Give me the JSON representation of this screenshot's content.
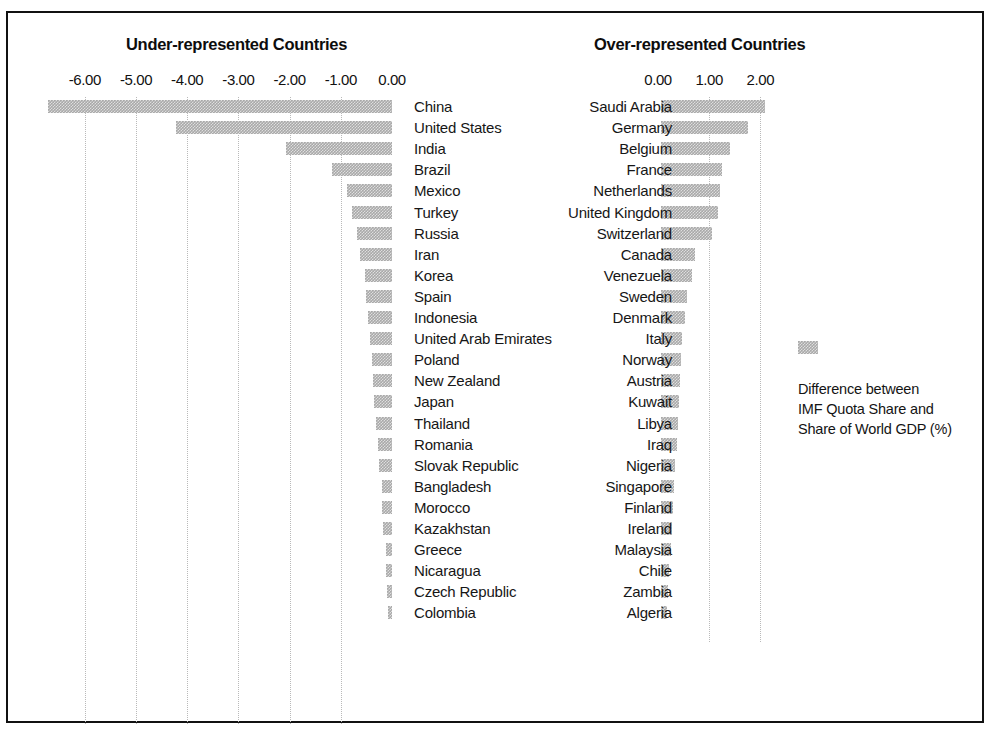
{
  "figure": {
    "legend": {
      "swatch_name": "bar-color-swatch",
      "color": "#a9a9a9",
      "line1": "Difference between",
      "line2": "IMF Quota Share and",
      "line3": "Share of World GDP (%)"
    }
  },
  "chart_data": [
    {
      "type": "bar",
      "orientation": "horizontal",
      "title": "Under-represented Countries",
      "xlabel": "",
      "ylabel": "",
      "xlim": [
        -7.0,
        0.0
      ],
      "xticks": [
        -6.0,
        -5.0,
        -4.0,
        -3.0,
        -2.0,
        -1.0,
        0.0
      ],
      "xticklabels": [
        "-6.00",
        "-5.00",
        "-4.00",
        "-3.00",
        "-2.00",
        "-1.00",
        "0.00"
      ],
      "grid": true,
      "legend_position": "right",
      "series_name": "Difference between IMF Quota Share and Share of World GDP (%)",
      "categories": [
        "China",
        "United States",
        "India",
        "Brazil",
        "Mexico",
        "Turkey",
        "Russia",
        "Iran",
        "Korea",
        "Spain",
        "Indonesia",
        "United Arab Emirates",
        "Poland",
        "New Zealand",
        "Japan",
        "Thailand",
        "Romania",
        "Slovak Republic",
        "Bangladesh",
        "Morocco",
        "Kazakhstan",
        "Greece",
        "Nicaragua",
        "Czech Republic",
        "Colombia"
      ],
      "values": [
        -6.72,
        -4.21,
        -2.07,
        -1.17,
        -0.88,
        -0.78,
        -0.68,
        -0.62,
        -0.53,
        -0.51,
        -0.47,
        -0.42,
        -0.4,
        -0.38,
        -0.35,
        -0.32,
        -0.28,
        -0.26,
        -0.19,
        -0.19,
        -0.17,
        -0.12,
        -0.11,
        -0.1,
        -0.08
      ]
    },
    {
      "type": "bar",
      "orientation": "horizontal",
      "title": "Over-represented Countries",
      "xlabel": "",
      "ylabel": "",
      "xlim": [
        0.0,
        2.2
      ],
      "xticks": [
        0.0,
        1.0,
        2.0
      ],
      "xticklabels": [
        "0.00",
        "1.00",
        "2.00"
      ],
      "grid": true,
      "legend_position": "right",
      "series_name": "Difference between IMF Quota Share and Share of World GDP (%)",
      "categories": [
        "Saudi Arabia",
        "Germany",
        "Belgium",
        "France",
        "Netherlands",
        "United Kingdom",
        "Switzerland",
        "Canada",
        "Venezuela",
        "Sweden",
        "Denmark",
        "Italy",
        "Norway",
        "Austria",
        "Kuwait",
        "Libya",
        "Iraq",
        "Nigeria",
        "Singapore",
        "Finland",
        "Ireland",
        "Malaysia",
        "Chile",
        "Zambia",
        "Algeria"
      ],
      "values": [
        2.04,
        1.69,
        1.35,
        1.2,
        1.16,
        1.12,
        1.0,
        0.66,
        0.61,
        0.51,
        0.47,
        0.41,
        0.4,
        0.38,
        0.36,
        0.33,
        0.31,
        0.28,
        0.26,
        0.24,
        0.22,
        0.19,
        0.16,
        0.14,
        0.12
      ]
    }
  ]
}
